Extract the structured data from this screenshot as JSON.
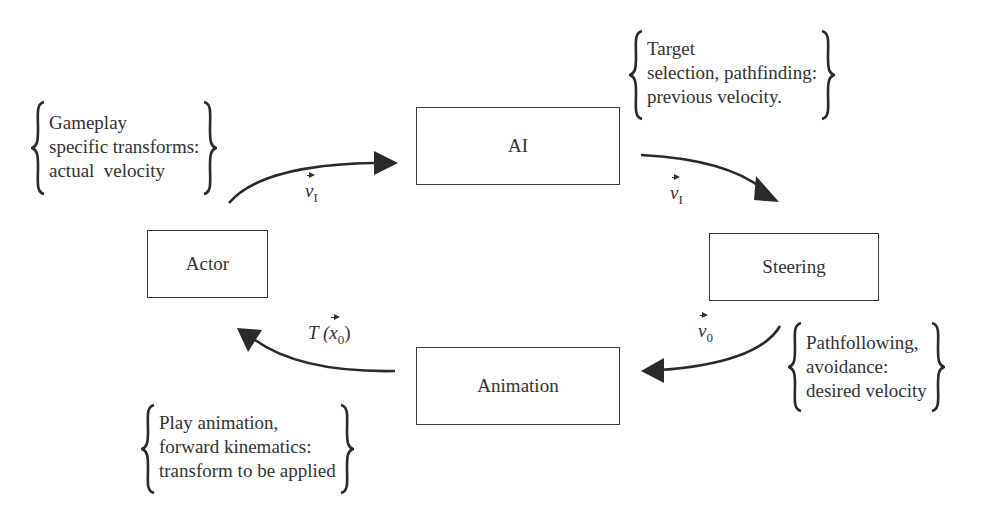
{
  "nodes": {
    "ai": "AI",
    "actor": "Actor",
    "steering": "Steering",
    "animation": "Animation"
  },
  "notes": {
    "actor_note": "Gameplay\nspecific transforms:\nactual  velocity",
    "ai_note": "Target\nselection, pathfinding:\nprevious velocity.",
    "steering_note": "Pathfollowing,\navoidance:\ndesired velocity",
    "animation_note": "Play animation,\nforward kinematics:\ntransform to be applied"
  },
  "edges": {
    "actor_to_ai": {
      "var": "v",
      "sub": "I"
    },
    "ai_to_steering": {
      "var": "v",
      "sub": "I"
    },
    "steering_to_animation": {
      "var": "v",
      "sub": "0"
    },
    "animation_to_actor": {
      "prefix": "T (",
      "var": "x",
      "sub": "0",
      "suffix": ")"
    }
  },
  "colors": {
    "stroke": "#2a2a2a",
    "text": "#333333"
  }
}
